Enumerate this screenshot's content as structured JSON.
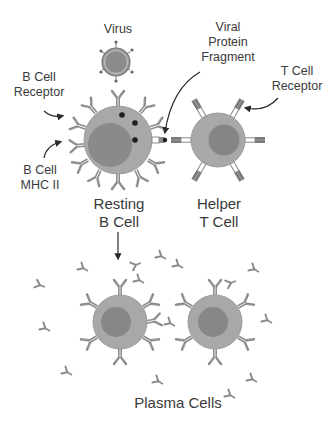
{
  "diagram": {
    "type": "b-cell-activation",
    "labels": {
      "virus": "Virus",
      "viral_protein_fragment": [
        "Viral",
        "Protein",
        "Fragment"
      ],
      "b_cell_receptor": [
        "B Cell",
        "Receptor"
      ],
      "t_cell_receptor": [
        "T Cell",
        "Receptor"
      ],
      "b_cell_mhc": [
        "B Cell",
        "MHC II"
      ],
      "resting_b_cell": [
        "Resting",
        "B Cell"
      ],
      "helper_t_cell": [
        "Helper",
        "T Cell"
      ],
      "plasma_cells": "Plasma Cells"
    },
    "colors": {
      "cell_body": "#a8a8a8",
      "nucleus": "#8a8a8a",
      "receptor": "#909090",
      "receptor_dark": "#707070",
      "dot": "#1e1e1e",
      "text": "#3a3a3a",
      "arrow": "#2a2a2a"
    },
    "nodes": [
      {
        "id": "virus",
        "cx": 116,
        "cy": 62,
        "r": 14
      },
      {
        "id": "resting-b-cell",
        "cx": 118,
        "cy": 140,
        "r": 34
      },
      {
        "id": "helper-t-cell",
        "cx": 218,
        "cy": 140,
        "r": 27
      },
      {
        "id": "plasma-cell-1",
        "cx": 120,
        "cy": 322,
        "r": 27
      },
      {
        "id": "plasma-cell-2",
        "cx": 215,
        "cy": 322,
        "r": 27
      }
    ],
    "edges": [
      {
        "from": "resting-b-cell",
        "to": "plasma-cells",
        "style": "arrow"
      },
      {
        "from": "b-cell-receptor-label",
        "to": "resting-b-cell",
        "style": "curved-arrow"
      },
      {
        "from": "b-cell-mhc-label",
        "to": "resting-b-cell",
        "style": "curved-arrow"
      },
      {
        "from": "viral-protein-fragment-label",
        "to": "mhc-complex",
        "style": "curved-arrow"
      },
      {
        "from": "t-cell-receptor-label",
        "to": "helper-t-cell",
        "style": "curved-arrow"
      }
    ]
  }
}
